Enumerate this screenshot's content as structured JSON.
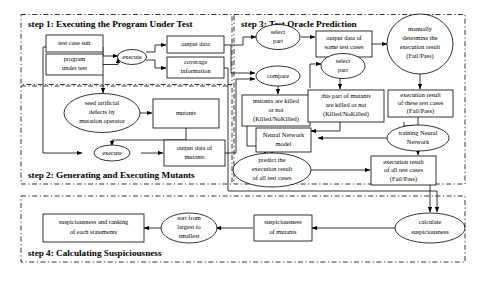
{
  "figure": {
    "width": 480,
    "height": 282,
    "background": "#ffffff",
    "stroke_color": "#000000"
  },
  "steps": [
    {
      "id": "step1",
      "label": "step 1: Executing the Program Under Test"
    },
    {
      "id": "step2",
      "label": "step 2: Generating and Executing Mutants"
    },
    {
      "id": "step3",
      "label": "step 3: Test Oracle Prediction"
    },
    {
      "id": "step4",
      "label": "step 4: Calculating Suspiciousness"
    }
  ],
  "nodes": {
    "test_case_suit": {
      "label": "test case suit",
      "shape": "box"
    },
    "program_under_test": {
      "label": "program\nunder test",
      "shape": "box"
    },
    "execute1": {
      "label": "execute",
      "shape": "ellipse"
    },
    "output_data": {
      "label": "output data",
      "shape": "box"
    },
    "coverage_information": {
      "label": "coverage\ninformation",
      "shape": "box"
    },
    "seed_defects": {
      "label": "seed artificial\ndefects by\nmutation operator",
      "shape": "ellipse"
    },
    "mutants": {
      "label": "mutants",
      "shape": "box"
    },
    "execute2": {
      "label": "execute",
      "shape": "ellipse"
    },
    "output_data_mutants": {
      "label": "output data of\nmutants",
      "shape": "box"
    },
    "select_part_1": {
      "label": "select\npart",
      "shape": "ellipse"
    },
    "output_some_cases": {
      "label": "output data of\nsome test cases",
      "shape": "box"
    },
    "manually_determine": {
      "label": "manually\ndetermine the\nexecution result\n(Fail/Pass)",
      "shape": "ellipse"
    },
    "compare": {
      "label": "compare",
      "shape": "ellipse"
    },
    "mutants_killed": {
      "label": "mutants are killed\nor not\n(Killed/NoKilled)",
      "shape": "box"
    },
    "select_part_2": {
      "label": "select\npart",
      "shape": "ellipse"
    },
    "this_part_mutants": {
      "label": "this part of mutants\nare killed or not\n(Killed/NoKilled)",
      "shape": "box"
    },
    "exec_result_these": {
      "label": "execution result\nof these test cases\n(Fail/Pass)",
      "shape": "box"
    },
    "nn_model": {
      "label": "Neural Network\nmodel",
      "shape": "box"
    },
    "training_nn": {
      "label": "training Neural\nNetwork",
      "shape": "ellipse"
    },
    "predict_result": {
      "label": "predict the\nexecution result\nof all test cases",
      "shape": "ellipse"
    },
    "exec_result_all": {
      "label": "execution result\nof all test cases\n(Fail/Pass)",
      "shape": "box"
    },
    "calculate_susp": {
      "label": "calculate\nsuspiciousness",
      "shape": "ellipse"
    },
    "susp_of_mutants": {
      "label": "suspiciousness\nof mutants",
      "shape": "box"
    },
    "sort_largest": {
      "label": "sort from\nlargest to\nsmallest",
      "shape": "ellipse"
    },
    "susp_ranking": {
      "label": "suspiciousness and ranking\nof each statements",
      "shape": "box"
    }
  }
}
